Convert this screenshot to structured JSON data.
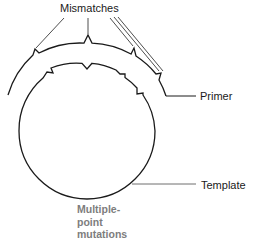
{
  "diagram": {
    "labels": {
      "mismatches": "Mismatches",
      "primer": "Primer",
      "template": "Template",
      "mutations": {
        "line1": "Multiple-",
        "line2": "point",
        "line3": "mutations"
      }
    },
    "colors": {
      "stroke": "#1a1a1a",
      "leader": "#3a3a3a",
      "template_leader": "#6e6e6e",
      "mutations_text": "#7d7d7d",
      "background": "#ffffff"
    },
    "geometry": {
      "center": [
        87,
        131
      ],
      "inner_radius": 68,
      "outer_radius": 88,
      "mismatch_count": 4
    }
  }
}
